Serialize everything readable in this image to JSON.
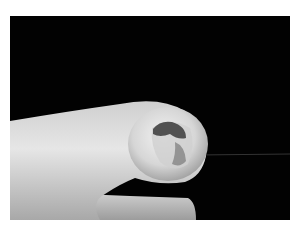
{
  "image": {
    "kind": "clinical-photograph",
    "subject": "finger with pigmented nail lesion",
    "colors": {
      "background": "#020202",
      "border": "#ffffff",
      "skin_light": "#e8e8e8",
      "skin_mid": "#b8b8b8",
      "lesion": "#3a3a3a"
    }
  }
}
